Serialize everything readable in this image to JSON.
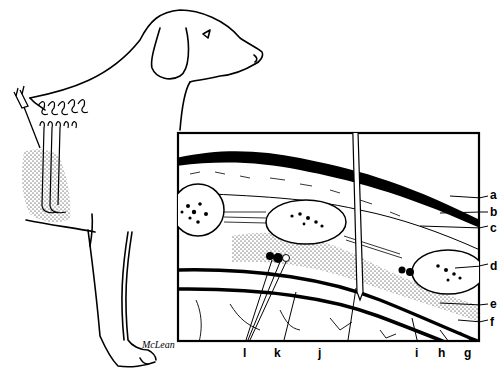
{
  "figure": {
    "type": "anatomical-illustration",
    "signature": "McLean",
    "colors": {
      "ink": "#000000",
      "background": "#ffffff"
    }
  },
  "inset": {
    "labels": [
      {
        "id": "a",
        "text": "a"
      },
      {
        "id": "b",
        "text": "b"
      },
      {
        "id": "c",
        "text": "c"
      },
      {
        "id": "d",
        "text": "d"
      },
      {
        "id": "e",
        "text": "e"
      },
      {
        "id": "f",
        "text": "f"
      },
      {
        "id": "g",
        "text": "g"
      },
      {
        "id": "h",
        "text": "h"
      },
      {
        "id": "i",
        "text": "i"
      },
      {
        "id": "j",
        "text": "j"
      },
      {
        "id": "k",
        "text": "k"
      },
      {
        "id": "l",
        "text": "l"
      }
    ]
  }
}
